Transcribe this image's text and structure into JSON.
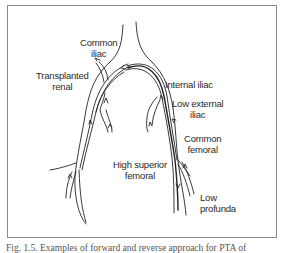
{
  "figure": {
    "labels": {
      "common_iliac": [
        "Common",
        "iliac"
      ],
      "transplanted_renal": [
        "Transplanted",
        "renal"
      ],
      "internal_iliac": [
        "Internal iliac"
      ],
      "low_external_iliac": [
        "Low external",
        "iliac"
      ],
      "common_femoral": [
        "Common",
        "femoral"
      ],
      "high_superior_femoral": [
        "High superior",
        "femoral"
      ],
      "low_profunda": [
        "Low",
        "profunda"
      ]
    },
    "caption": "Fig. 1.5. Examples of forward and reverse approach for PTA of"
  }
}
